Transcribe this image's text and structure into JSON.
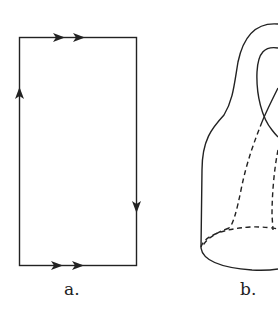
{
  "figure": {
    "panels": [
      {
        "id": "a",
        "label": "a.",
        "description": "Square/rectangle identification diagram with edge arrows",
        "edges": [
          {
            "side": "top",
            "arrows": 2,
            "direction": "right"
          },
          {
            "side": "bottom",
            "arrows": 2,
            "direction": "right"
          },
          {
            "side": "left",
            "arrows": 1,
            "direction": "up"
          },
          {
            "side": "right",
            "arrows": 1,
            "direction": "down"
          }
        ]
      },
      {
        "id": "b",
        "label": "b.",
        "description": "Klein bottle immersion with dashed hidden lines"
      }
    ],
    "colors": {
      "stroke": "#222222",
      "background": "#ffffff"
    }
  }
}
